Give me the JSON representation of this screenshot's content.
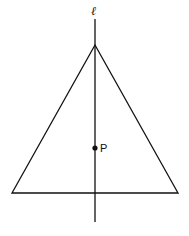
{
  "diagram": {
    "line_label": "ℓ",
    "point_label": "P",
    "triangle": {
      "apex": [
        95,
        45
      ],
      "base_left": [
        12,
        193
      ],
      "base_right": [
        178,
        193
      ]
    },
    "line": {
      "x": 95,
      "y_top": 19,
      "y_bottom": 222
    },
    "point": [
      95,
      148
    ],
    "stroke_color": "#111111"
  }
}
